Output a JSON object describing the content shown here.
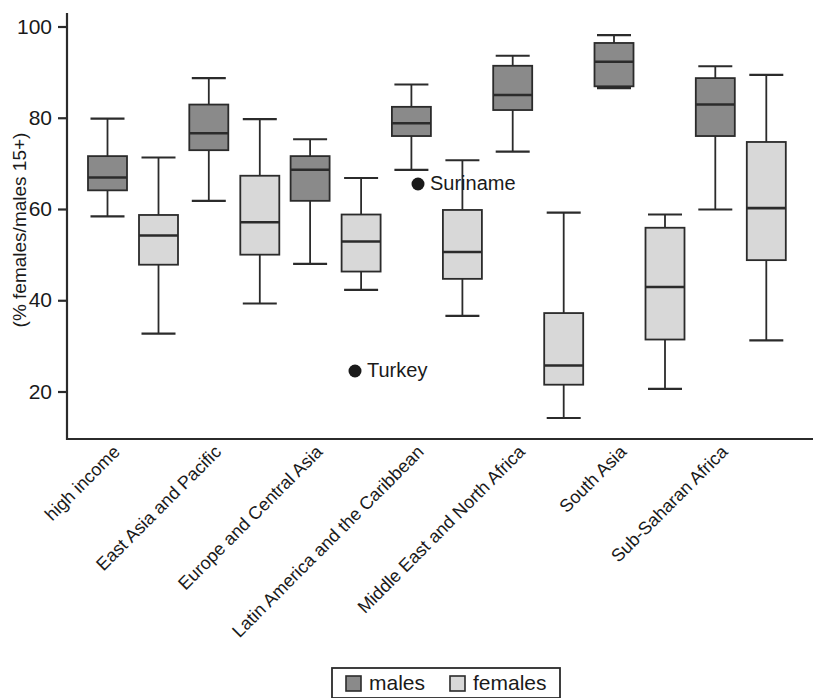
{
  "chart_data": {
    "type": "box",
    "title": "",
    "xlabel": "",
    "ylabel": "(% females/males 15+)",
    "ylim": [
      14,
      104
    ],
    "grid": false,
    "y_ticks": [
      20,
      40,
      60,
      80,
      100
    ],
    "y_tick_labels": [
      "20",
      "40",
      "60",
      "80",
      "100"
    ],
    "categories": [
      "high income",
      "East Asia and Pacific",
      "Europe and Central Asia",
      "Latin America and the Caribbean",
      "Middle East and North Africa",
      "South Asia",
      "Sub-Saharan Africa"
    ],
    "legend": {
      "position": "bottom",
      "entries": [
        {
          "name": "males",
          "color": "#8a8a8a"
        },
        {
          "name": "females",
          "color": "#d8d8d8"
        }
      ]
    },
    "series": [
      {
        "name": "males",
        "color": "#8a8a8a",
        "boxes": [
          {
            "category": "high income",
            "whisker_low": 58.5,
            "q1": 64.2,
            "median": 67.0,
            "q3": 71.7,
            "whisker_high": 79.9
          },
          {
            "category": "East Asia and Pacific",
            "whisker_low": 61.9,
            "q1": 73.0,
            "median": 76.7,
            "q3": 83.0,
            "whisker_high": 88.8
          },
          {
            "category": "Europe and Central Asia",
            "whisker_low": 48.1,
            "q1": 61.9,
            "median": 68.7,
            "q3": 71.7,
            "whisker_high": 75.4
          },
          {
            "category": "Latin America and the Caribbean",
            "whisker_low": 68.7,
            "q1": 76.1,
            "median": 78.9,
            "q3": 82.5,
            "whisker_high": 87.4
          },
          {
            "category": "Middle East and North Africa",
            "whisker_low": 72.7,
            "q1": 81.8,
            "median": 85.1,
            "q3": 91.5,
            "whisker_high": 93.7
          },
          {
            "category": "South Asia",
            "whisker_low": 86.6,
            "q1": 87.0,
            "median": 92.4,
            "q3": 96.5,
            "whisker_high": 98.2
          },
          {
            "category": "Sub-Saharan Africa",
            "whisker_low": 60.0,
            "q1": 76.1,
            "median": 83.0,
            "q3": 88.8,
            "whisker_high": 91.4
          }
        ]
      },
      {
        "name": "females",
        "color": "#d8d8d8",
        "boxes": [
          {
            "category": "high income",
            "whisker_low": 32.8,
            "q1": 47.9,
            "median": 54.3,
            "q3": 58.8,
            "whisker_high": 71.4
          },
          {
            "category": "East Asia and Pacific",
            "whisker_low": 39.4,
            "q1": 50.1,
            "median": 57.2,
            "q3": 67.4,
            "whisker_high": 79.8
          },
          {
            "category": "Europe and Central Asia",
            "whisker_low": 42.4,
            "q1": 46.4,
            "median": 53.0,
            "q3": 58.9,
            "whisker_high": 66.9
          },
          {
            "category": "Latin America and the Caribbean",
            "whisker_low": 36.7,
            "q1": 44.8,
            "median": 50.7,
            "q3": 59.9,
            "whisker_high": 70.8
          },
          {
            "category": "Middle East and North Africa",
            "whisker_low": 14.3,
            "q1": 21.6,
            "median": 25.8,
            "q3": 37.3,
            "whisker_high": 59.3
          },
          {
            "category": "South Asia",
            "whisker_low": 20.7,
            "q1": 31.5,
            "median": 43.0,
            "q3": 56.0,
            "whisker_high": 58.9
          },
          {
            "category": "Sub-Saharan Africa",
            "whisker_low": 31.3,
            "q1": 48.9,
            "median": 60.3,
            "q3": 74.8,
            "whisker_high": 89.5
          }
        ]
      }
    ],
    "annotations": [
      {
        "label": "Suriname",
        "value": 64.0,
        "category": "Latin America and the Caribbean",
        "series": "males"
      },
      {
        "label": "Turkey",
        "value": 23.0,
        "category": "Europe and Central Asia",
        "series": "females"
      }
    ]
  }
}
